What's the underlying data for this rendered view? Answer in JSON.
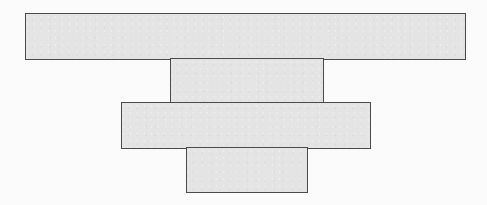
{
  "diagram": {
    "type": "stacked-rectangles",
    "fill_color": "#e4e4e4",
    "border_color": "#4a4a4a",
    "background_color": "#fbfbfb",
    "blocks": [
      {
        "id": "block-1",
        "x": 25,
        "y": 13,
        "width": 441,
        "height": 47,
        "label": ""
      },
      {
        "id": "block-2",
        "x": 170,
        "y": 58,
        "width": 154,
        "height": 46,
        "label": ""
      },
      {
        "id": "block-3",
        "x": 121,
        "y": 102,
        "width": 250,
        "height": 47,
        "label": ""
      },
      {
        "id": "block-4",
        "x": 186,
        "y": 147,
        "width": 122,
        "height": 46,
        "label": ""
      }
    ]
  }
}
